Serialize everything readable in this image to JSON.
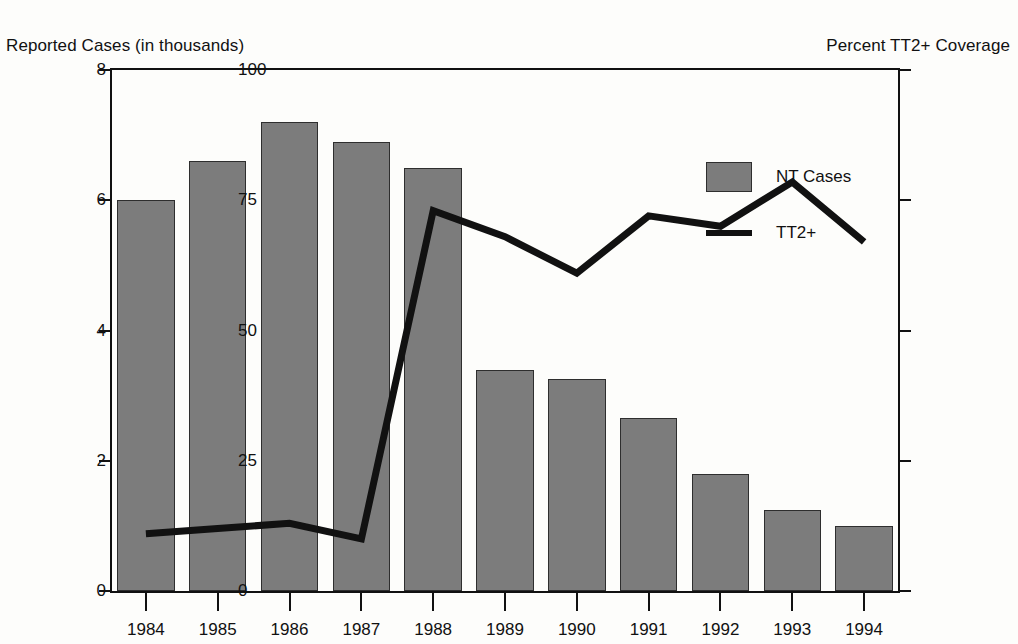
{
  "chart_data": {
    "type": "bar",
    "title": "",
    "categories": [
      "1984",
      "1985",
      "1986",
      "1987",
      "1988",
      "1989",
      "1990",
      "1991",
      "1992",
      "1993",
      "1994"
    ],
    "xlabel": "",
    "ylabel": "Reported Cases (in thousands)",
    "y2label": "Percent TT2+ Coverage",
    "ylim": [
      0,
      8
    ],
    "y2lim": [
      0,
      100
    ],
    "yticks": [
      "0",
      "2",
      "4",
      "6",
      "8"
    ],
    "ytick_values": [
      0,
      2,
      4,
      6,
      8
    ],
    "y2ticks": [
      "0",
      "25",
      "50",
      "75",
      "100"
    ],
    "y2tick_values": [
      0,
      25,
      50,
      75,
      100
    ],
    "grid": false,
    "legend_position": "upper-center-right",
    "series": [
      {
        "name": "NT Cases",
        "type": "bar",
        "axis": "left",
        "color": "#7c7c7c",
        "edge_color": "#2e2e2e",
        "values": [
          6.0,
          6.6,
          7.2,
          6.9,
          6.5,
          3.4,
          3.25,
          2.65,
          1.8,
          1.25,
          1.0
        ]
      },
      {
        "name": "TT2+",
        "type": "line",
        "axis": "right",
        "color": "#111111",
        "values": [
          11,
          12,
          13,
          10,
          73,
          68,
          61,
          72,
          70,
          78.5,
          67
        ]
      }
    ]
  },
  "legend": {
    "items": [
      {
        "label": "NT Cases",
        "marker": "bar-swatch"
      },
      {
        "label": "TT2+",
        "marker": "line-swatch"
      }
    ]
  }
}
